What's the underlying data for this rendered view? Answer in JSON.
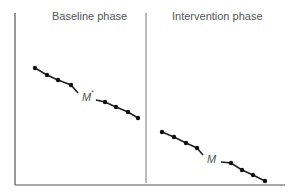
{
  "chart_data": {
    "type": "line",
    "title": "",
    "xlabel": "",
    "ylabel": "",
    "grid": false,
    "legend": null,
    "phases": [
      {
        "name": "Baseline phase",
        "mean_label": "M*",
        "mean_main": "M",
        "mean_sup": "*",
        "points": [
          [
            35,
            68
          ],
          [
            47,
            75
          ],
          [
            58,
            80
          ],
          [
            71,
            85
          ],
          [
            105,
            102
          ],
          [
            116,
            107
          ],
          [
            128,
            112
          ],
          [
            138,
            118
          ]
        ],
        "mean_pos": [
          87,
          97
        ]
      },
      {
        "name": "Intervention phase",
        "mean_label": "M",
        "mean_main": "M",
        "mean_sup": "",
        "points": [
          [
            162,
            132
          ],
          [
            174,
            137
          ],
          [
            186,
            143
          ],
          [
            197,
            148
          ],
          [
            231,
            163
          ],
          [
            242,
            170
          ],
          [
            253,
            175
          ],
          [
            265,
            181
          ]
        ],
        "mean_pos": [
          212,
          159
        ]
      }
    ],
    "axes": {
      "y_axis_x": 15,
      "x_axis_y": 185,
      "top": 13,
      "right": 285,
      "phase_divider_x": 146
    },
    "trend": "decreasing in both phases; intervention level lower than baseline"
  },
  "labels": {
    "baseline": "Baseline phase",
    "intervention": "Intervention phase"
  },
  "colors": {
    "axis": "#555555",
    "line": "#222222",
    "point": "#111111",
    "text": "#555555"
  }
}
